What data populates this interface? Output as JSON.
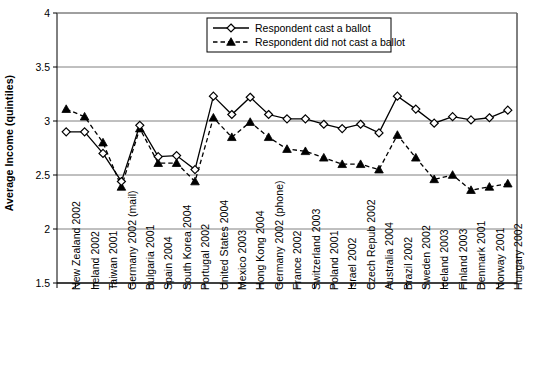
{
  "chart_data": {
    "type": "line",
    "title": "",
    "xlabel": "",
    "ylabel": "Average Income (quintiles)",
    "ylim": [
      1.5,
      4
    ],
    "yticks": [
      1.5,
      2,
      2.5,
      3,
      3.5,
      4
    ],
    "ytick_labels": [
      "1.5",
      "2",
      "2.5",
      "3",
      "3.5",
      "4"
    ],
    "grid": "horizontal",
    "legend_position": "top-center",
    "categories": [
      "New Zealand 2002",
      "Ireland 2002",
      "Taiwan 2001",
      "Germany 2002 (mail)",
      "Bulgaria 2001",
      "Spain 2004",
      "South Korea 2004",
      "Portugal 2002",
      "United States 2004",
      "Mexico 2003",
      "Hong Kong 2004",
      "Germany 2002 (phone)",
      "France 2002",
      "Switzerland 2003",
      "Poland 2001",
      "Israel 2002",
      "Czech Repub 2002",
      "Australia 2004",
      "Brazil 2002",
      "Sweden 2002",
      "Iceland 2003",
      "Finland 2003",
      "Denmark 2001",
      "Norway 2001",
      "Hungary 2002"
    ],
    "series": [
      {
        "name": "Respondent cast a ballot",
        "marker": "open-diamond",
        "line": "solid",
        "color": "#000000",
        "values": [
          2.9,
          2.9,
          2.7,
          2.44,
          2.96,
          2.67,
          2.68,
          2.55,
          3.23,
          3.06,
          3.22,
          3.06,
          3.02,
          3.02,
          2.97,
          2.93,
          2.97,
          2.89,
          3.23,
          3.11,
          2.98,
          3.04,
          3.01,
          3.03,
          3.1
        ]
      },
      {
        "name": "Respondent did not cast a ballot",
        "marker": "filled-triangle",
        "line": "dashed",
        "color": "#000000",
        "values": [
          3.11,
          3.04,
          2.8,
          2.39,
          2.93,
          2.61,
          2.61,
          2.44,
          3.03,
          2.85,
          2.99,
          2.85,
          2.74,
          2.72,
          2.66,
          2.6,
          2.6,
          2.55,
          2.87,
          2.66,
          2.46,
          2.5,
          2.36,
          2.39,
          2.42
        ]
      }
    ]
  },
  "legend": {
    "entries": [
      "Respondent cast a ballot",
      "Respondent did not cast a ballot"
    ]
  }
}
